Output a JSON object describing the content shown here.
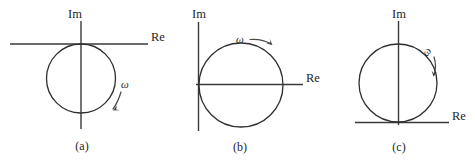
{
  "figure": {
    "background_color": "#ffffff",
    "stroke_color": "#2e2e2e",
    "panels": [
      {
        "id": "a",
        "caption": "(a)",
        "imaginary_axis_label": "Im",
        "real_axis_label": "Re",
        "omega_label": "ω",
        "circle": {
          "cx": 81,
          "cy": 78.5,
          "r": 34.5
        },
        "tangent_point": "top of circle touches the real axis at the origin",
        "rotation_direction": "clockwise"
      },
      {
        "id": "b",
        "caption": "(b)",
        "imaginary_axis_label": "Im",
        "real_axis_label": "Re",
        "omega_label": "ω",
        "circle": {
          "cx": 241,
          "cy": 85,
          "r": 42
        },
        "tangent_point": "left of circle touches the imaginary axis at the origin",
        "rotation_direction": "clockwise"
      },
      {
        "id": "c",
        "caption": "(c)",
        "imaginary_axis_label": "Im",
        "real_axis_label": "Re",
        "omega_label": "ω",
        "circle": {
          "cx": 398,
          "cy": 83,
          "r": 39
        },
        "tangent_point": "bottom of circle touches the real axis at the origin",
        "rotation_direction": "clockwise"
      }
    ]
  }
}
